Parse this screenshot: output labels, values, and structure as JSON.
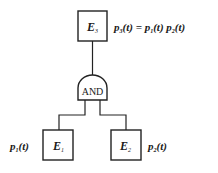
{
  "diagram": {
    "type": "fault-tree",
    "top_event": {
      "label": "E",
      "subscript": "3",
      "equation_lhs": "p",
      "equation_lhs_sub": "3",
      "equation_text": "(t) = ",
      "equation_rhs_1": "p",
      "equation_rhs_1_sub": "1",
      "equation_rhs_1_text": "(t) ",
      "equation_rhs_2": "p",
      "equation_rhs_2_sub": "2",
      "equation_rhs_2_text": "(t)"
    },
    "gate": {
      "label": "AND"
    },
    "children": [
      {
        "label": "E",
        "subscript": "1",
        "prob": "p",
        "prob_sub": "1",
        "prob_text": "(t)"
      },
      {
        "label": "E",
        "subscript": "2",
        "prob": "p",
        "prob_sub": "2",
        "prob_text": "(t)"
      }
    ]
  }
}
